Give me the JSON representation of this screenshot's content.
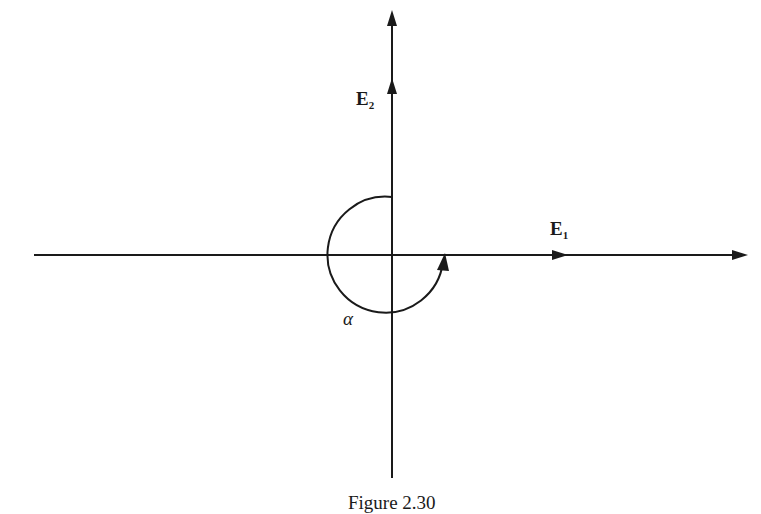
{
  "figure": {
    "caption": "Figure 2.30",
    "axes": {
      "e1": {
        "label": "E",
        "subscript": "1"
      },
      "e2": {
        "label": "E",
        "subscript": "2"
      }
    },
    "angle_label": "α",
    "colors": {
      "ink": "#1a1a1a",
      "background": "#ffffff"
    }
  }
}
